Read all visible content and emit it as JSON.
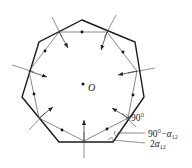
{
  "diagram": {
    "title": "",
    "center_label": "O",
    "angle_labels": {
      "right_angle": "90°",
      "complement_prefix": "90°−",
      "alpha": "α",
      "alpha_sub": "12",
      "double_prefix": "2"
    },
    "outer_polygon": [
      [
        82,
        20
      ],
      [
        135,
        42
      ],
      [
        144,
        97
      ],
      [
        113,
        142
      ],
      [
        59,
        142
      ],
      [
        22,
        97
      ],
      [
        39,
        42
      ]
    ],
    "inner_polygon": [
      [
        59,
        32
      ],
      [
        107,
        32
      ],
      [
        137,
        71
      ],
      [
        128,
        118
      ],
      [
        84,
        141
      ],
      [
        39,
        118
      ],
      [
        29,
        71
      ]
    ],
    "colors": {
      "stroke": "#1a1a1a",
      "background": "#ffffff"
    }
  }
}
